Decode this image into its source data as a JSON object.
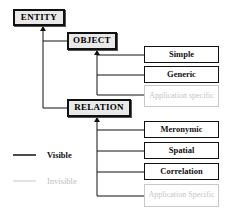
{
  "diagram": {
    "root": {
      "label": "ENTITY"
    },
    "object": {
      "label": "OBJECT",
      "children": [
        {
          "label": "Simple",
          "visibility": "visible"
        },
        {
          "label": "Generic",
          "visibility": "visible"
        },
        {
          "label": "Application specific",
          "visibility": "invisible"
        }
      ]
    },
    "relation": {
      "label": "RELATION",
      "children": [
        {
          "label": "Meronymic",
          "visibility": "visible"
        },
        {
          "label": "Spatial",
          "visibility": "visible"
        },
        {
          "label": "Correlation",
          "visibility": "visible"
        },
        {
          "label": "Application Specific",
          "visibility": "invisible"
        }
      ]
    },
    "legend": [
      {
        "label": "Visible",
        "color": "#111111"
      },
      {
        "label": "Invisible",
        "color": "#c8c8c8"
      }
    ]
  }
}
